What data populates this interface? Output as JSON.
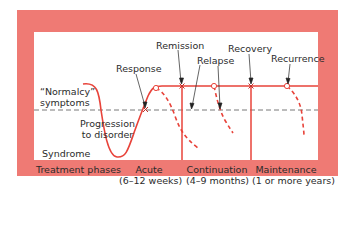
{
  "diagram": {
    "colors": {
      "panel": "#ef7a74",
      "inner": "#ffffff",
      "curve": "#e8433a",
      "dashed_baseline": "#555555",
      "text": "#2b2b2b",
      "arrow": "#222222"
    },
    "y_labels": {
      "normalcy_line1": "“Normalcy”",
      "normalcy_line2": "symptoms",
      "syndrome": "Syndrome"
    },
    "annotations": {
      "progression_line1": "Progression",
      "progression_line2": "to disorder",
      "response": "Response",
      "remission": "Remission",
      "relapse": "Relapse",
      "recovery": "Recovery",
      "recurrence": "Recurrence"
    },
    "phases": {
      "title": "Treatment phases",
      "acute_line1": "Acute",
      "acute_line2": "(6–12 weeks)",
      "continuation_line1": "Continuation",
      "continuation_line2": "(4–9 months)",
      "maintenance_line1": "Maintenance",
      "maintenance_line2": "(1 or more years)"
    }
  }
}
